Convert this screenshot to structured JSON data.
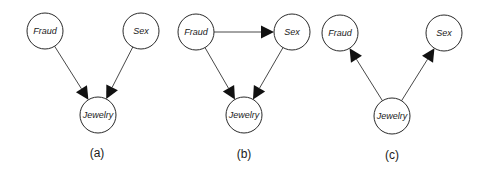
{
  "diagrams": [
    {
      "caption": "(a)",
      "nodes": {
        "fraud": {
          "label": "Fraud",
          "x": 45,
          "y": 31
        },
        "sex": {
          "label": "Sex",
          "x": 141,
          "y": 31
        },
        "jewelry": {
          "label": "Jewelry",
          "x": 98,
          "y": 115
        }
      },
      "edges": [
        {
          "from": "fraud",
          "to": "jewelry"
        },
        {
          "from": "sex",
          "to": "jewelry"
        }
      ],
      "caption_pos": {
        "x": 97,
        "y": 154
      }
    },
    {
      "caption": "(b)",
      "nodes": {
        "fraud": {
          "label": "Fraud",
          "x": 196,
          "y": 32
        },
        "sex": {
          "label": "Sex",
          "x": 292,
          "y": 32
        },
        "jewelry": {
          "label": "Jewelry",
          "x": 244,
          "y": 115
        }
      },
      "edges": [
        {
          "from": "fraud",
          "to": "sex"
        },
        {
          "from": "fraud",
          "to": "jewelry"
        },
        {
          "from": "sex",
          "to": "jewelry"
        }
      ],
      "caption_pos": {
        "x": 244,
        "y": 155
      }
    },
    {
      "caption": "(c)",
      "nodes": {
        "fraud": {
          "label": "Fraud",
          "x": 340,
          "y": 33
        },
        "sex": {
          "label": "Sex",
          "x": 444,
          "y": 33
        },
        "jewelry": {
          "label": "Jewelry",
          "x": 392,
          "y": 116
        }
      },
      "edges": [
        {
          "from": "jewelry",
          "to": "fraud"
        },
        {
          "from": "jewelry",
          "to": "sex"
        }
      ],
      "caption_pos": {
        "x": 392,
        "y": 156
      }
    }
  ],
  "style": {
    "node_radius": 18,
    "stroke_color": "#2a2a2a",
    "arrow_color": "#111111"
  }
}
